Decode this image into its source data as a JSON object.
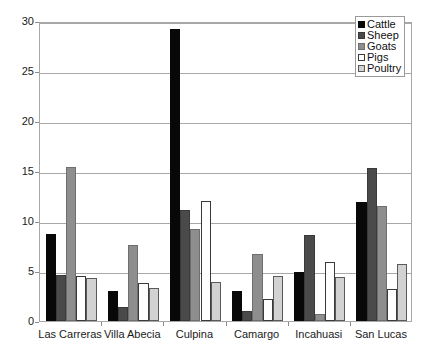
{
  "chart_data": {
    "type": "bar",
    "title": "",
    "subtitle": "",
    "xlabel": "",
    "ylabel": "",
    "ylim": [
      0,
      30
    ],
    "yticks": [
      0,
      5,
      10,
      15,
      20,
      25,
      30
    ],
    "ytick_labels": [
      "0",
      "5",
      "10",
      "15",
      "20",
      "25",
      "30"
    ],
    "grid": true,
    "grid_axis": "y",
    "legend_position": "top-right",
    "bar_layout": "grouped",
    "categories": [
      "Las Carreras",
      "Villa Abecia",
      "Culpina",
      "Camargo",
      "Incahuasi",
      "San Lucas"
    ],
    "series": [
      {
        "name": "Cattle",
        "color": "#080808",
        "values": [
          8.7,
          3.0,
          29.2,
          3.0,
          4.9,
          11.9
        ]
      },
      {
        "name": "Sheep",
        "color": "#4a4a4a",
        "values": [
          4.6,
          1.4,
          11.1,
          1.0,
          8.6,
          15.3
        ]
      },
      {
        "name": "Goats",
        "color": "#8e8e8e",
        "values": [
          15.4,
          7.6,
          9.2,
          6.7,
          0.7,
          11.5
        ]
      },
      {
        "name": "Pigs",
        "color": "#ffffff",
        "values": [
          4.5,
          3.8,
          12.0,
          2.2,
          5.9,
          3.2
        ]
      },
      {
        "name": "Poultry",
        "color": "#d2d2d2",
        "values": [
          4.3,
          3.3,
          3.9,
          4.5,
          4.4,
          5.7
        ]
      }
    ]
  },
  "legend": {
    "entries": [
      "Cattle",
      "Sheep",
      "Goats",
      "Pigs",
      "Poultry"
    ]
  },
  "axes": {
    "frame_color": "#a8a8a8",
    "tick_color": "#8c8c8c",
    "text_color": "#1a1a1a"
  }
}
